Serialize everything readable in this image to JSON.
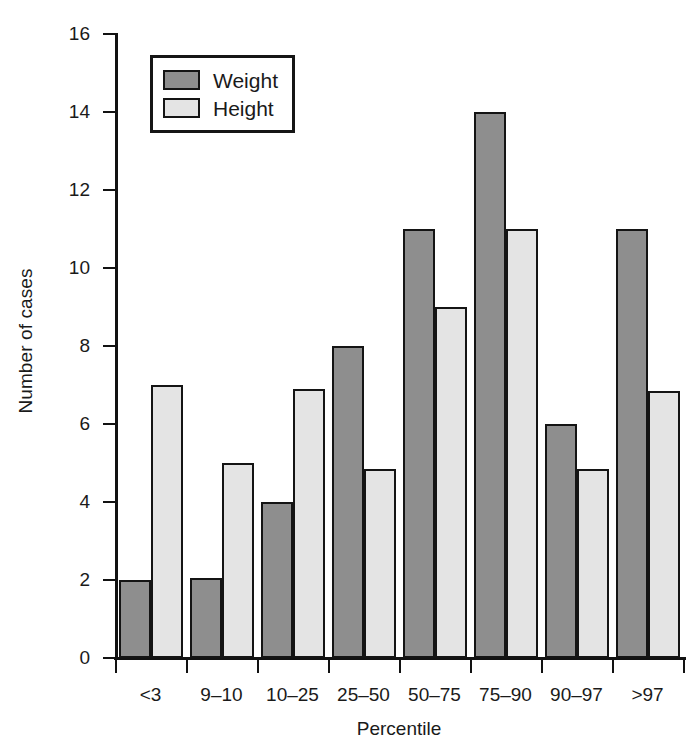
{
  "chart_data": {
    "type": "bar",
    "title": "",
    "xlabel": "Percentile",
    "ylabel": "Number of cases",
    "categories": [
      "<3",
      "9–10",
      "10–25",
      "25–50",
      "50–75",
      "75–90",
      "90–97",
      ">97"
    ],
    "series": [
      {
        "name": "Weight",
        "color": "#8e8e8e",
        "values": [
          2,
          2.05,
          4,
          8,
          11,
          14,
          6,
          11
        ]
      },
      {
        "name": "Height",
        "color": "#e4e4e4",
        "values": [
          7,
          5,
          6.9,
          4.85,
          9,
          11,
          4.85,
          6.85
        ]
      }
    ],
    "ylim": [
      0,
      16
    ],
    "ytick_values": [
      0,
      2,
      4,
      6,
      8,
      10,
      12,
      14,
      16
    ],
    "ytick_labels": [
      "0",
      "2",
      "4",
      "6",
      "8",
      "10",
      "12",
      "14",
      "16"
    ],
    "grid": false,
    "legend_position": "top-left-inside"
  },
  "legend": {
    "entries": [
      {
        "label": "Weight",
        "swatch": "weight-swatch"
      },
      {
        "label": "Height",
        "swatch": "height-swatch"
      }
    ]
  },
  "axes": {
    "y_title": "Number of cases",
    "x_title": "Percentile"
  }
}
